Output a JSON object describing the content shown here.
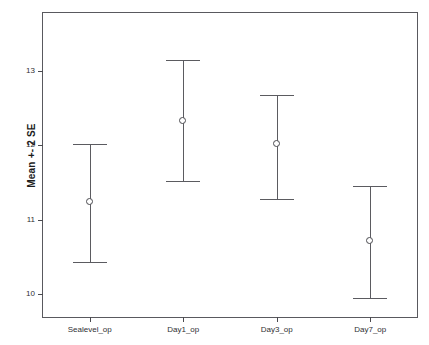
{
  "chart_data": {
    "type": "scatter",
    "title": "",
    "xlabel": "",
    "ylabel": "Mean +- 2 SE",
    "categories": [
      "Sealevel_op",
      "Day1_op",
      "Day3_op",
      "Day7_op"
    ],
    "ylim": [
      9.7,
      13.8
    ],
    "yticks": [
      10,
      11,
      12,
      13
    ],
    "ytick_labels": [
      "10",
      "11",
      "12",
      "13"
    ],
    "grid": false,
    "legend": null,
    "error_type": "Mean +/- 2 SE",
    "series": [
      {
        "name": "Mean +- 2 SE",
        "points": [
          {
            "category": "Sealevel_op",
            "mean": 11.25,
            "lower": 10.44,
            "upper": 12.03
          },
          {
            "category": "Day1_op",
            "mean": 12.35,
            "lower": 11.53,
            "upper": 13.16
          },
          {
            "category": "Day3_op",
            "mean": 12.03,
            "lower": 11.29,
            "upper": 12.69
          },
          {
            "category": "Day7_op",
            "mean": 10.72,
            "lower": 9.96,
            "upper": 11.47
          }
        ]
      }
    ],
    "colors": {
      "line": "#5b5b60",
      "marker_edge": "#4a4a4f",
      "marker_fill": "#ffffff",
      "frame": "#59595e",
      "text": "#2f2f33",
      "background": "#ffffff"
    }
  }
}
